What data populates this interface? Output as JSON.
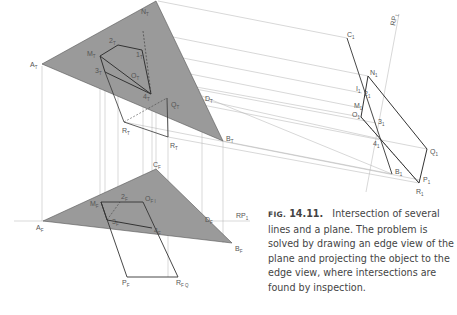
{
  "figure": {
    "number_prefix": "FIG.",
    "number": "14.11.",
    "caption": "Intersection of several lines and a plane. The problem is solved by drawing an edge view of the plane and projecting the object to the edge view, where intersections are found by inspection."
  },
  "colors": {
    "plane_fill": "#9a9a9a",
    "object_line": "#333333",
    "projection_line": "#aaaaaa",
    "label": "#555555"
  },
  "labels": {
    "top": {
      "A": "A",
      "A_sub": "T",
      "N": "N",
      "N_sub": "T",
      "M": "M",
      "M_sub": "T",
      "two": "2",
      "two_sub": "T",
      "one": "1",
      "one_sub": "T",
      "three": "3",
      "three_sub": "T",
      "O": "O",
      "O_sub": "T",
      "four": "4",
      "four_sub": "T",
      "Q": "Q",
      "Q_sub": "T",
      "D": "D",
      "D_sub": "T",
      "B": "B",
      "B_sub": "T",
      "P": "R",
      "P_sub": "T",
      "R": "R",
      "R_sub": "T"
    },
    "front": {
      "C": "C",
      "C_sub": "F",
      "M": "M",
      "M_sub": "F",
      "two": "2",
      "two_sub": "F",
      "OIN": "O",
      "OIN_sub": "F I",
      "OIN_sub2": "F N",
      "OIN_sub3": "F",
      "three": "3",
      "three_sub": "F",
      "four": "4",
      "four_sub": "F",
      "A": "A",
      "A_sub": "F",
      "D": "D",
      "D_sub": "F",
      "B": "B",
      "B_sub": "F",
      "P": "P",
      "P_sub": "F",
      "RQ": "R",
      "RQ_sub": "F Q",
      "RQ_sub2": "F",
      "RP": "RP",
      "RP_sub": "1"
    },
    "aux": {
      "C": "C",
      "C_sub": "1",
      "RP": "RP",
      "RP_sub": "1",
      "N": "N",
      "N_sub": "1",
      "I": "I",
      "I_sub": "1",
      "two": "2",
      "two_sub": "1",
      "M": "M",
      "M_sub": "1",
      "O": "O",
      "O_sub": "1",
      "three": "3",
      "three_sub": "1",
      "four": "4",
      "four_sub": "1",
      "Q": "Q",
      "Q_sub": "1",
      "B": "B",
      "B_sub": "1",
      "P": "P",
      "P_sub": "1",
      "R": "R",
      "R_sub": "1"
    }
  }
}
